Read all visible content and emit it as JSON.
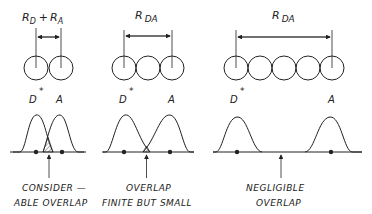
{
  "panels": [
    {
      "id": "considerable",
      "distance_label": {
        "main": "R",
        "sub1": "D",
        "plus": "+",
        "main2": "R",
        "sub2": "A"
      },
      "donor_label": "D",
      "donor_star": "*",
      "acceptor_label": "A",
      "caption_line1": "CONSIDER —",
      "caption_line2": "ABLE OVERLAP",
      "circle_count": 2
    },
    {
      "id": "finite",
      "distance_label": {
        "main": "R",
        "sub": "DA"
      },
      "donor_label": "D",
      "donor_star": "*",
      "acceptor_label": "A",
      "caption_line1": "OVERLAP",
      "caption_line2": "FINITE BUT SMALL",
      "circle_count": 3
    },
    {
      "id": "negligible",
      "distance_label": {
        "main": "R",
        "sub": "DA"
      },
      "donor_label": "D",
      "donor_star": "*",
      "acceptor_label": "A",
      "caption_line1": "NEGLIGIBLE",
      "caption_line2": "OVERLAP",
      "circle_count": 5
    }
  ],
  "colors": {
    "ink": "#222222",
    "background": "#ffffff",
    "hatch": "#555555"
  }
}
